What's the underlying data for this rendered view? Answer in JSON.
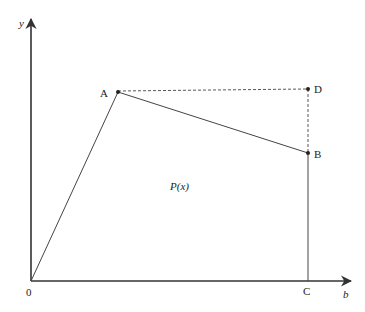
{
  "figure": {
    "type": "geometric-diagram",
    "axes": {
      "x_label": "b",
      "y_label": "y",
      "origin_label": "0"
    },
    "points": {
      "A": {
        "label": "A",
        "px": [
          118,
          92
        ]
      },
      "B": {
        "label": "B",
        "px": [
          308,
          153
        ]
      },
      "C": {
        "label": "C",
        "px": [
          308,
          281
        ]
      },
      "D": {
        "label": "D",
        "px": [
          308,
          89
        ]
      },
      "O": {
        "label": "0",
        "px": [
          31,
          281
        ]
      }
    },
    "region_label": "P(x)",
    "segments": {
      "solid": [
        "O-A",
        "A-B",
        "B-C"
      ],
      "dashed": [
        "A-D",
        "D-B"
      ]
    },
    "colors": {
      "line": "#333333",
      "text": "#222222",
      "background": "#ffffff"
    }
  }
}
